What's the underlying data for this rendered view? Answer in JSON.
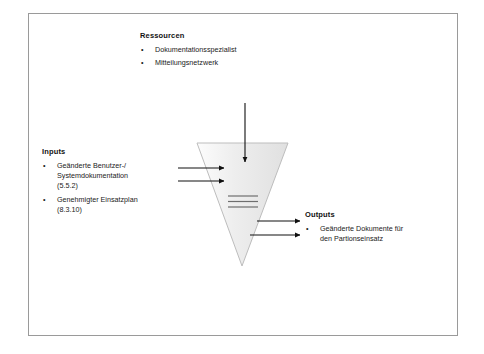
{
  "diagram": {
    "type": "ipo-process-diagram",
    "frame": {
      "border_color": "#9a9a9a"
    },
    "process_shape": {
      "name": "inverted-triangle",
      "fill_light": "#fafafa",
      "fill_dark": "#e3e3e3",
      "stroke": "#b5b5b5",
      "inner_line_count": 3,
      "inner_line_color": "#6e6e6e"
    },
    "arrow_color": "#101010",
    "resources": {
      "heading": "Ressourcen",
      "items": [
        "Dokumentationsspezialist",
        "Mitteilungsnetzwerk"
      ],
      "bullet": "•",
      "arrow_count": 1
    },
    "inputs": {
      "heading": "Inputs",
      "items": [
        "Geänderte Benutzer-/\nSystemdokumentation\n(5.5.2)",
        "Genehmigter Einsatzplan\n(8.3.10)"
      ],
      "bullet": "•",
      "arrow_count": 2
    },
    "outputs": {
      "heading": "Outputs",
      "items": [
        "Geänderte Dokumente für\nden Partionseinsatz"
      ],
      "bullet": "•",
      "arrow_count": 2
    }
  }
}
